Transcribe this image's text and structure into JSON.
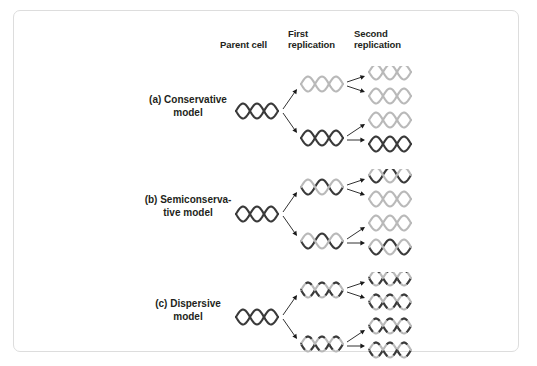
{
  "figure": {
    "column_headers": [
      {
        "id": "parent-cell",
        "label": "Parent cell"
      },
      {
        "id": "first-replication",
        "label": "First\nreplication"
      },
      {
        "id": "second-replication",
        "label": "Second\nreplication"
      }
    ],
    "models": [
      {
        "id": "conservative",
        "label": "(a) Conservative\nmodel"
      },
      {
        "id": "semiconservative",
        "label": "(b) Semiconserva-\ntive model"
      },
      {
        "id": "dispersive",
        "label": "(c) Dispersive\nmodel"
      }
    ],
    "colors": {
      "old_strand": "#3a3a3a",
      "new_strand": "#b9b9b9",
      "arrow": "#1a1a1a",
      "border": "#dddddd",
      "background": "#ffffff",
      "text": "#231f20"
    },
    "strand_legend": {
      "dark": "parental (old) strand",
      "light": "newly synthesized strand"
    }
  },
  "chart_data": {
    "type": "diagram",
    "columns": [
      "Parent cell",
      "First replication",
      "Second replication"
    ],
    "rows": [
      {
        "model": "(a) Conservative model",
        "parent": [
          {
            "strands": [
              "dark",
              "dark"
            ]
          }
        ],
        "first_replication": [
          {
            "strands": [
              "light",
              "light"
            ]
          },
          {
            "strands": [
              "dark",
              "dark"
            ]
          }
        ],
        "second_replication": [
          {
            "strands": [
              "light",
              "light"
            ]
          },
          {
            "strands": [
              "light",
              "light"
            ]
          },
          {
            "strands": [
              "light",
              "light"
            ]
          },
          {
            "strands": [
              "dark",
              "dark"
            ]
          }
        ]
      },
      {
        "model": "(b) Semiconservative model",
        "parent": [
          {
            "strands": [
              "dark",
              "dark"
            ]
          }
        ],
        "first_replication": [
          {
            "strands": [
              "dark",
              "light"
            ]
          },
          {
            "strands": [
              "dark",
              "light"
            ]
          }
        ],
        "second_replication": [
          {
            "strands": [
              "dark",
              "light"
            ]
          },
          {
            "strands": [
              "light",
              "light"
            ]
          },
          {
            "strands": [
              "light",
              "light"
            ]
          },
          {
            "strands": [
              "dark",
              "light"
            ]
          }
        ]
      },
      {
        "model": "(c) Dispersive model",
        "parent": [
          {
            "strands": [
              "dark",
              "dark"
            ]
          }
        ],
        "first_replication": [
          {
            "strands": [
              "mixed",
              "mixed"
            ]
          },
          {
            "strands": [
              "mixed",
              "mixed"
            ]
          }
        ],
        "second_replication": [
          {
            "strands": [
              "mixed",
              "mixed"
            ]
          },
          {
            "strands": [
              "mixed",
              "mixed"
            ]
          },
          {
            "strands": [
              "mixed",
              "mixed"
            ]
          },
          {
            "strands": [
              "mixed",
              "mixed"
            ]
          }
        ]
      }
    ]
  }
}
